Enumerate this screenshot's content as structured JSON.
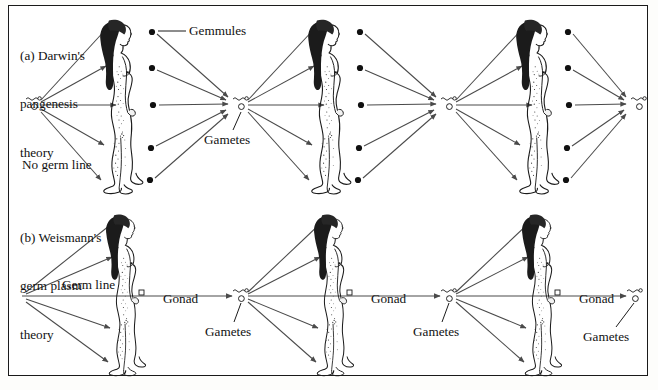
{
  "figure": {
    "kind": "scientific-diagram",
    "background_color": "#fdfdfb",
    "frame_color": "#1a1a1a",
    "ink_color": "#111111",
    "arrow_color": "#4a4a4a"
  },
  "panels": [
    {
      "id": "a",
      "title_lines": [
        "(a) Darwin's",
        "pangenesis",
        "theory"
      ],
      "title_text": "(a) Darwin's pangenesis theory",
      "labels": [
        {
          "name": "gemmules",
          "text": "Gemmules"
        },
        {
          "name": "gametes",
          "text": "Gametes"
        },
        {
          "name": "no-germ-line",
          "text": "No germ line"
        }
      ],
      "generations": 3,
      "gemmule_dots_per_figure": 5,
      "description": "Gametes give rise to a whole body; gemmules from all body parts collect into the next generation's gametes; no separate germ line."
    },
    {
      "id": "b",
      "title_lines": [
        "(b) Weismann's",
        "germ plasm",
        "theory"
      ],
      "title_text": "(b) Weismann's germ plasm theory",
      "labels": [
        {
          "name": "germ-line",
          "text": "Germ line"
        },
        {
          "name": "gonad-1",
          "text": "Gonad"
        },
        {
          "name": "gonad-2",
          "text": "Gonad"
        },
        {
          "name": "gonad-3",
          "text": "Gonad"
        },
        {
          "name": "gametes-1",
          "text": "Gametes"
        },
        {
          "name": "gametes-2",
          "text": "Gametes"
        },
        {
          "name": "gametes-3",
          "text": "Gametes"
        }
      ],
      "generations": 3,
      "description": "A continuous germ line passes through the gonad to the gametes of the next generation; the body is a side branch."
    }
  ],
  "symbols": {
    "gamete_sperm": "squiggle-with-head",
    "gamete_egg": "small-open-circle",
    "gemmule": "filled-black-dot"
  }
}
